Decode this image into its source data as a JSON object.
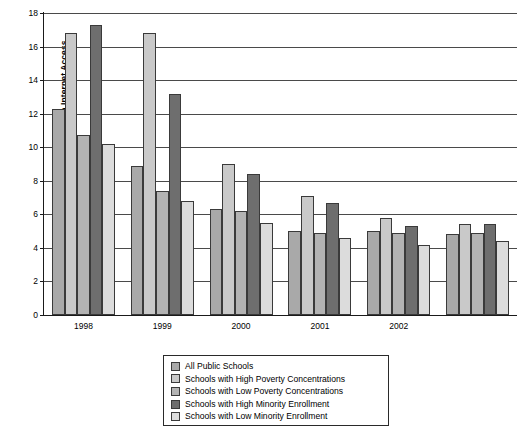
{
  "chart_data": {
    "type": "bar",
    "title": "",
    "xlabel": "",
    "ylabel": "Number of Students per Computer with Internet Access",
    "ylim": [
      0,
      18
    ],
    "yticks": [
      0,
      2,
      4,
      6,
      8,
      10,
      12,
      14,
      16,
      18
    ],
    "grid": true,
    "legend_position": "bottom-center",
    "categories": [
      "1998",
      "1999",
      "2000",
      "2001",
      "2002",
      ""
    ],
    "series": [
      {
        "name": "All Public Schools",
        "color": "#a9a9a9",
        "values": [
          12.3,
          8.9,
          6.3,
          5.0,
          5.0,
          4.8
        ]
      },
      {
        "name": "Schools with High Poverty Concentrations",
        "color": "#c9c9c9",
        "values": [
          16.8,
          16.8,
          9.0,
          7.1,
          5.8,
          5.4
        ]
      },
      {
        "name": "Schools with Low Poverty Concentrations",
        "color": "#b3b3b3",
        "values": [
          10.7,
          7.4,
          6.2,
          4.9,
          4.9,
          4.9
        ]
      },
      {
        "name": "Schools with High Minority Enrollment",
        "color": "#6e6e6e",
        "values": [
          17.3,
          13.2,
          8.4,
          6.7,
          5.3,
          5.4
        ]
      },
      {
        "name": "Schools with Low Minority Enrollment",
        "color": "#dcdcdc",
        "values": [
          10.2,
          6.8,
          5.5,
          4.6,
          4.2,
          4.4
        ]
      }
    ]
  }
}
